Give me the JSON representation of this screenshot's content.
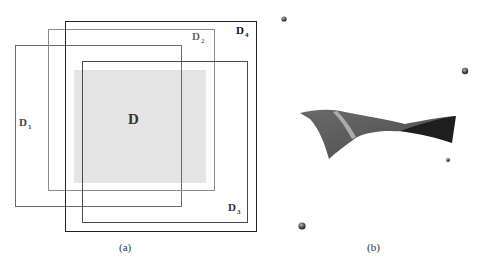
{
  "panels": {
    "a": {
      "caption": "(a)",
      "regions": [
        {
          "id": "D1",
          "base": "D",
          "sub": "1",
          "stroke": "#6a6a6a"
        },
        {
          "id": "D2",
          "base": "D",
          "sub": "2",
          "stroke": "#8c8c8c"
        },
        {
          "id": "D3",
          "base": "D",
          "sub": "3",
          "stroke": "#4a4a4a"
        },
        {
          "id": "D4",
          "base": "D",
          "sub": "4",
          "stroke": "#222222"
        }
      ],
      "center_region": {
        "label": "D",
        "fill": "#e4e4e4"
      }
    },
    "b": {
      "caption": "(b)",
      "surface_colors": {
        "main": "#5a5a5a",
        "dark": "#1e1e1e",
        "highlight": "#b5b5b5"
      },
      "sphere_color": "#444444"
    }
  }
}
